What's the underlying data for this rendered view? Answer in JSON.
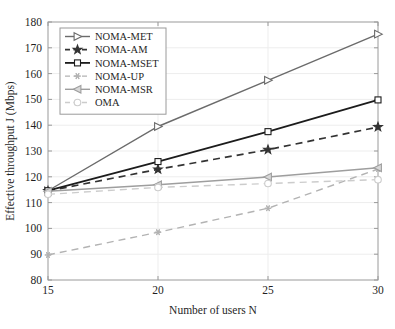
{
  "figure": {
    "background": "#ffffff",
    "plot_left": 48,
    "plot_right": 378,
    "plot_top": 22,
    "plot_bottom": 280
  },
  "chart_data": {
    "type": "line",
    "title": "",
    "xlabel": "Number of users N",
    "ylabel": "Effective throughput J (Mbps)",
    "x": [
      15,
      20,
      25,
      30
    ],
    "xticklabels": [
      "15",
      "20",
      "25",
      "30"
    ],
    "yticks": [
      80,
      90,
      100,
      110,
      120,
      130,
      140,
      150,
      160,
      170,
      180
    ],
    "yticklabels": [
      "80",
      "90",
      "100",
      "110",
      "120",
      "130",
      "140",
      "150",
      "160",
      "170",
      "180"
    ],
    "xlim": [
      15,
      30
    ],
    "ylim": [
      80,
      180
    ],
    "grid": true,
    "legend_position": "upper left",
    "series": [
      {
        "name": "NOMA-MET",
        "values": [
          114.6,
          139.5,
          157.4,
          175.3
        ],
        "color": "#6b6b6b",
        "dash": "none",
        "marker": "triangle-right",
        "marker_fill": "#ffffff",
        "width": 1.4
      },
      {
        "name": "NOMA-AM",
        "values": [
          114.5,
          122.9,
          130.5,
          139.3
        ],
        "color": "#333333",
        "dash": "dashed",
        "marker": "star",
        "marker_fill": "#333333",
        "width": 1.7
      },
      {
        "name": "NOMA-MSET",
        "values": [
          114.6,
          125.9,
          137.5,
          149.8
        ],
        "color": "#1c1c1c",
        "dash": "none",
        "marker": "square",
        "marker_fill": "#ffffff",
        "width": 1.8
      },
      {
        "name": "NOMA-UP",
        "values": [
          89.7,
          98.5,
          107.8,
          123.0
        ],
        "color": "#b3b3b3",
        "dash": "dashed",
        "marker": "asterisk",
        "marker_fill": "#b3b3b3",
        "width": 1.4
      },
      {
        "name": "NOMA-MSR",
        "values": [
          114.4,
          116.9,
          119.9,
          123.5
        ],
        "color": "#9e9e9e",
        "dash": "none",
        "marker": "triangle-left",
        "marker_fill": "#d8d8d8",
        "width": 1.4
      },
      {
        "name": "OMA",
        "values": [
          113.2,
          115.9,
          117.4,
          118.9
        ],
        "color": "#cccccc",
        "dash": "dashed",
        "marker": "circle",
        "marker_fill": "#ffffff",
        "width": 1.4
      }
    ]
  }
}
